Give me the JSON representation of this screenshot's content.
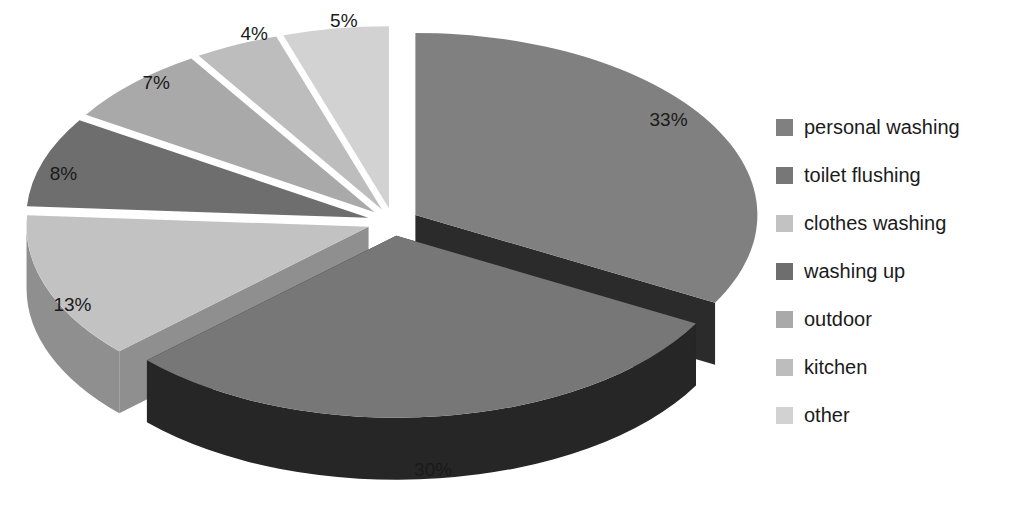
{
  "chart_data": {
    "type": "pie",
    "title": "",
    "subtitle": "",
    "xlabel": "",
    "ylabel": "",
    "style": "3d-exploded-pie",
    "grid": false,
    "legend_position": "right",
    "units": "percent",
    "categories": [
      "personal washing",
      "toilet flushing",
      "clothes washing",
      "washing up",
      "outdoor",
      "kitchen",
      "other"
    ],
    "values": [
      33,
      30,
      13,
      8,
      7,
      4,
      5
    ],
    "data_labels": [
      "33%",
      "30%",
      "13%",
      "8%",
      "7%",
      "4%",
      "5%"
    ],
    "colors": [
      "#808080",
      "#777777",
      "#c2c2c2",
      "#6e6e6e",
      "#a9a9a9",
      "#bdbdbd",
      "#d2d2d2"
    ],
    "side_colors": [
      "#2b2b2b",
      "#262626",
      "#8f8f8f",
      "#3a3a3a",
      "#6f6f6f",
      "#787878",
      "#8a8a8a"
    ],
    "slices": [
      {
        "label": "personal washing",
        "value": 33,
        "data_label": "33%",
        "color": "#808080",
        "side_color": "#2b2b2b"
      },
      {
        "label": "toilet flushing",
        "value": 30,
        "data_label": "30%",
        "color": "#777777",
        "side_color": "#262626"
      },
      {
        "label": "clothes washing",
        "value": 13,
        "data_label": "13%",
        "color": "#c2c2c2",
        "side_color": "#8f8f8f"
      },
      {
        "label": "washing up",
        "value": 8,
        "data_label": "8%",
        "color": "#6e6e6e",
        "side_color": "#3a3a3a"
      },
      {
        "label": "outdoor",
        "value": 7,
        "data_label": "7%",
        "color": "#a9a9a9",
        "side_color": "#6f6f6f"
      },
      {
        "label": "kitchen",
        "value": 4,
        "data_label": "4%",
        "color": "#bdbdbd",
        "side_color": "#787878"
      },
      {
        "label": "other",
        "value": 5,
        "data_label": "5%",
        "color": "#d2d2d2",
        "side_color": "#8a8a8a"
      }
    ]
  },
  "labels": {
    "personal_washing": "33%",
    "toilet_flushing": "30%",
    "clothes_washing": "13%",
    "washing_up": "8%",
    "outdoor": "7%",
    "kitchen": "4%",
    "other": "5%"
  },
  "legend": {
    "items": [
      {
        "label": "personal washing",
        "color": "#808080"
      },
      {
        "label": "toilet flushing",
        "color": "#777777"
      },
      {
        "label": "clothes washing",
        "color": "#c2c2c2"
      },
      {
        "label": "washing up",
        "color": "#6e6e6e"
      },
      {
        "label": "outdoor",
        "color": "#a9a9a9"
      },
      {
        "label": "kitchen",
        "color": "#bdbdbd"
      },
      {
        "label": "other",
        "color": "#d2d2d2"
      }
    ]
  }
}
